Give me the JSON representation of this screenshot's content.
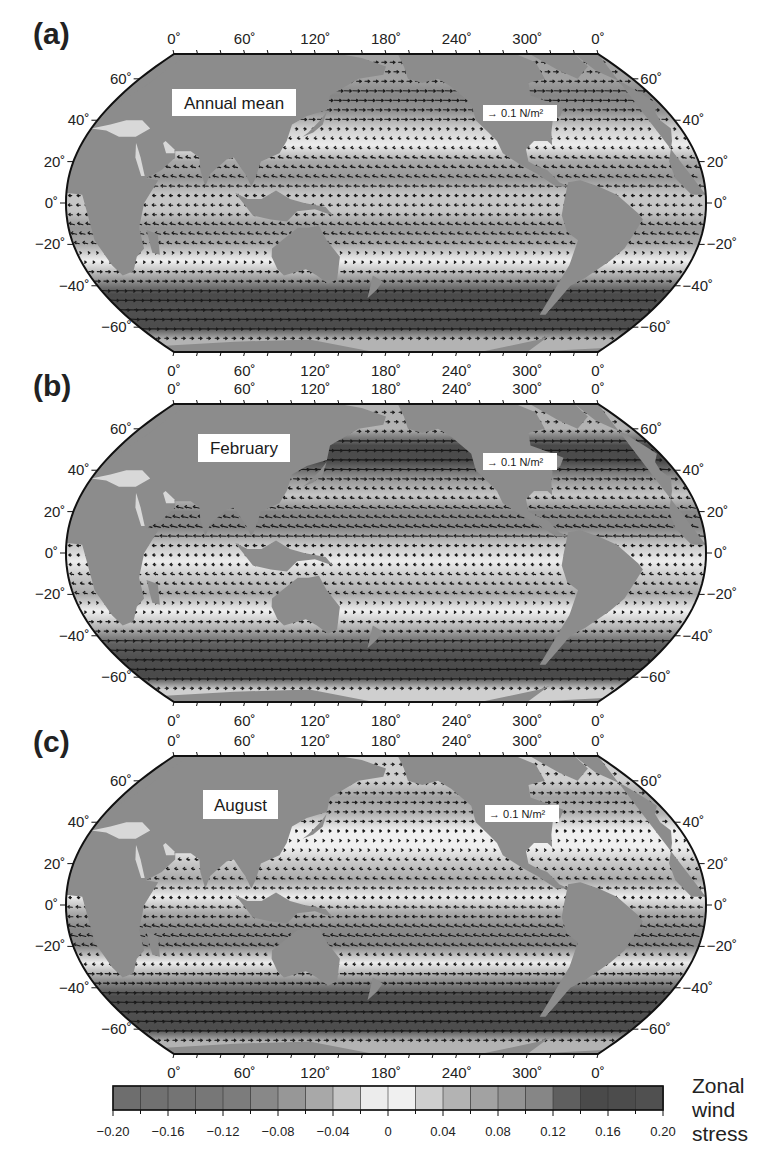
{
  "figure": {
    "panels": [
      {
        "letter": "(a)",
        "title": "Annual mean",
        "scale_label": "→ 0.1 N/m²",
        "offset_y": 0,
        "bands": [
          {
            "lat": 60,
            "v": 0.06
          },
          {
            "lat": 52,
            "v": 0.1
          },
          {
            "lat": 44,
            "v": 0.08
          },
          {
            "lat": 36,
            "v": 0.02
          },
          {
            "lat": 28,
            "v": -0.02
          },
          {
            "lat": 20,
            "v": -0.06
          },
          {
            "lat": 12,
            "v": -0.07
          },
          {
            "lat": 4,
            "v": -0.03
          },
          {
            "lat": -4,
            "v": -0.04
          },
          {
            "lat": -12,
            "v": -0.07
          },
          {
            "lat": -20,
            "v": -0.06
          },
          {
            "lat": -28,
            "v": 0.0
          },
          {
            "lat": -36,
            "v": 0.06
          },
          {
            "lat": -44,
            "v": 0.14
          },
          {
            "lat": -52,
            "v": 0.19
          },
          {
            "lat": -60,
            "v": 0.16
          },
          {
            "lat": -66,
            "v": 0.04
          }
        ]
      },
      {
        "letter": "(b)",
        "title": "February",
        "scale_label": "→ 0.1 N/m²",
        "offset_y": 350,
        "bands": [
          {
            "lat": 60,
            "v": 0.04
          },
          {
            "lat": 52,
            "v": 0.14
          },
          {
            "lat": 44,
            "v": 0.17
          },
          {
            "lat": 36,
            "v": 0.08
          },
          {
            "lat": 28,
            "v": -0.04
          },
          {
            "lat": 20,
            "v": -0.09
          },
          {
            "lat": 12,
            "v": -0.1
          },
          {
            "lat": 4,
            "v": -0.04
          },
          {
            "lat": -4,
            "v": -0.02
          },
          {
            "lat": -12,
            "v": -0.04
          },
          {
            "lat": -20,
            "v": -0.05
          },
          {
            "lat": -28,
            "v": 0.0
          },
          {
            "lat": -36,
            "v": 0.05
          },
          {
            "lat": -44,
            "v": 0.13
          },
          {
            "lat": -52,
            "v": 0.17
          },
          {
            "lat": -60,
            "v": 0.14
          },
          {
            "lat": -66,
            "v": 0.03
          }
        ]
      },
      {
        "letter": "(c)",
        "title": "August",
        "scale_label": "→ 0.1 N/m²",
        "offset_y": 702,
        "bands": [
          {
            "lat": 60,
            "v": 0.03
          },
          {
            "lat": 52,
            "v": 0.06
          },
          {
            "lat": 44,
            "v": 0.05
          },
          {
            "lat": 36,
            "v": 0.01
          },
          {
            "lat": 28,
            "v": 0.0
          },
          {
            "lat": 20,
            "v": -0.03
          },
          {
            "lat": 12,
            "v": -0.05
          },
          {
            "lat": 4,
            "v": -0.02
          },
          {
            "lat": -4,
            "v": -0.06
          },
          {
            "lat": -12,
            "v": -0.1
          },
          {
            "lat": -20,
            "v": -0.09
          },
          {
            "lat": -28,
            "v": -0.02
          },
          {
            "lat": -36,
            "v": 0.08
          },
          {
            "lat": -44,
            "v": 0.17
          },
          {
            "lat": -52,
            "v": 0.2
          },
          {
            "lat": -60,
            "v": 0.17
          },
          {
            "lat": -66,
            "v": 0.05
          }
        ]
      }
    ],
    "lon_ticks": [
      "0˚",
      "60˚",
      "120˚",
      "180˚",
      "240˚",
      "300˚",
      "0˚"
    ],
    "lat_ticks_left": [
      "60˚",
      "40˚",
      "20˚",
      "0˚",
      "−20˚",
      "−40˚",
      "−60˚"
    ],
    "lat_ticks_right": [
      "60˚",
      "40˚",
      "20˚",
      "0˚",
      "−20˚",
      "−40˚",
      "−60˚"
    ],
    "colorbar": {
      "title_lines": [
        "Zonal",
        "wind",
        "stress"
      ],
      "tick_labels": [
        "−0.20",
        "−0.16",
        "−0.12",
        "−0.08",
        "−0.04",
        "0",
        "0.04",
        "0.08",
        "0.12",
        "0.16",
        "0.20"
      ],
      "cell_colors": [
        "#6e6e6e",
        "#717171",
        "#747474",
        "#777777",
        "#7c7c7c",
        "#888888",
        "#979797",
        "#a8a8a8",
        "#c6c6c6",
        "#ececec",
        "#f0f0f0",
        "#cfcfcf",
        "#b3b3b3",
        "#a2a2a2",
        "#939393",
        "#868686",
        "#5f5f5f",
        "#4a4a4a",
        "#4c4c4c",
        "#505050"
      ]
    },
    "colors": {
      "land": "#8c8c8c",
      "frame": "#111111",
      "arrow": "#1a1a1a",
      "background": "#ffffff"
    }
  },
  "chart_data": {
    "type": "heatmap",
    "panels": [
      "(a) Annual mean",
      "(b) February",
      "(c) August"
    ],
    "xlabel": "Longitude",
    "ylabel": "Latitude",
    "x_ticks": [
      "0°",
      "60°",
      "120°",
      "180°",
      "240°",
      "300°",
      "0°"
    ],
    "y_ticks": [
      "60°",
      "40°",
      "20°",
      "0°",
      "-20°",
      "-40°",
      "-60°"
    ],
    "vector_scale": "0.1 N/m^2",
    "colorbar": {
      "label": "Zonal wind stress",
      "range": [
        -0.2,
        0.2
      ],
      "ticks": [
        -0.2,
        -0.16,
        -0.12,
        -0.08,
        -0.04,
        0,
        0.04,
        0.08,
        0.12,
        0.16,
        0.2
      ],
      "n_levels": 20
    },
    "zonal_mean_approx": {
      "latitudes": [
        60,
        50,
        40,
        30,
        20,
        10,
        0,
        -10,
        -20,
        -30,
        -40,
        -50,
        -60
      ],
      "series": [
        {
          "name": "Annual mean",
          "values": [
            0.06,
            0.1,
            0.06,
            0.0,
            -0.06,
            -0.07,
            -0.03,
            -0.07,
            -0.06,
            0.0,
            0.1,
            0.19,
            0.14
          ]
        },
        {
          "name": "February",
          "values": [
            0.05,
            0.16,
            0.14,
            0.0,
            -0.09,
            -0.1,
            -0.03,
            -0.04,
            -0.05,
            0.0,
            0.09,
            0.17,
            0.13
          ]
        },
        {
          "name": "August",
          "values": [
            0.03,
            0.06,
            0.04,
            0.0,
            -0.03,
            -0.05,
            -0.04,
            -0.1,
            -0.09,
            -0.02,
            0.13,
            0.2,
            0.15
          ]
        }
      ]
    }
  }
}
